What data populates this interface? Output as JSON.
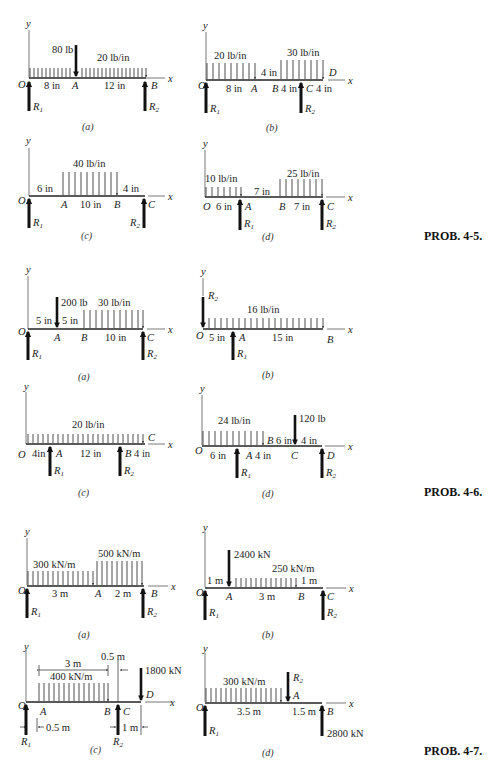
{
  "figure": {
    "problems": [
      {
        "label": "PROB. 4-5.",
        "panels": [
          {
            "caption": "(a)",
            "point_load": "80 lb",
            "dist_load": "20 lb/in",
            "dims": [
              "8 in",
              "12 in"
            ],
            "points": [
              "O",
              "A",
              "B"
            ],
            "reactions": [
              "R1",
              "R2"
            ]
          },
          {
            "caption": "(b)",
            "dist_loads": [
              "20 lb/in",
              "30 lb/in"
            ],
            "dims": [
              "8 in",
              "4 in",
              "4 in",
              "4 in"
            ],
            "points": [
              "O",
              "A",
              "B",
              "C",
              "D"
            ],
            "reactions": [
              "R1",
              "R2"
            ]
          },
          {
            "caption": "(c)",
            "dist_load": "40 lb/in",
            "dims": [
              "6 in",
              "10 in",
              "4 in"
            ],
            "points": [
              "O",
              "A",
              "B",
              "C"
            ],
            "reactions": [
              "R1",
              "R2"
            ]
          },
          {
            "caption": "(d)",
            "dist_loads": [
              "10 lb/in",
              "25 lb/in"
            ],
            "dims": [
              "6 in",
              "7 in",
              "7 in"
            ],
            "points": [
              "O",
              "A",
              "B",
              "C"
            ],
            "reactions": [
              "R1",
              "R2"
            ]
          }
        ]
      },
      {
        "label": "PROB. 4-6.",
        "panels": [
          {
            "caption": "(a)",
            "point_load": "200 lb",
            "dist_load": "30 lb/in",
            "dims": [
              "5 in",
              "5 in",
              "10 in"
            ],
            "points": [
              "O",
              "A",
              "B",
              "C"
            ],
            "reactions": [
              "R1",
              "R2"
            ]
          },
          {
            "caption": "(b)",
            "dist_load": "16 lb/in",
            "dims": [
              "5 in",
              "15 in"
            ],
            "points": [
              "O",
              "A",
              "B"
            ],
            "reactions": [
              "R1",
              "R2"
            ]
          },
          {
            "caption": "(c)",
            "dist_load": "20 lb/in",
            "dims": [
              "4in",
              "12 in",
              "4 in"
            ],
            "points": [
              "O",
              "A",
              "B",
              "C"
            ],
            "reactions": [
              "R1",
              "R2"
            ]
          },
          {
            "caption": "(d)",
            "point_load": "120 lb",
            "dist_load": "24 lb/in",
            "dims": [
              "6 in",
              "4 in",
              "6 in",
              "4 in"
            ],
            "points": [
              "O",
              "A",
              "B",
              "C",
              "D"
            ],
            "reactions": [
              "R1",
              "R2"
            ]
          }
        ]
      },
      {
        "label": "PROB. 4-7.",
        "panels": [
          {
            "caption": "(a)",
            "dist_loads": [
              "300 kN/m",
              "500 kN/m"
            ],
            "dims": [
              "3 m",
              "2 m"
            ],
            "points": [
              "O",
              "A",
              "B"
            ],
            "reactions": [
              "R1",
              "R2"
            ]
          },
          {
            "caption": "(b)",
            "point_load": "2400 kN",
            "dist_load": "250 kN/m",
            "dims": [
              "1 m",
              "3 m",
              "1 m"
            ],
            "points": [
              "O",
              "A",
              "B",
              "C"
            ],
            "reactions": [
              "R1",
              "R2"
            ]
          },
          {
            "caption": "(c)",
            "point_load": "1800 kN",
            "dist_load": "400 kN/m",
            "dims": [
              "3 m",
              "0.5 m",
              "0.5 m",
              "1 m"
            ],
            "points": [
              "O",
              "A",
              "B",
              "C",
              "D"
            ],
            "reactions": [
              "R1",
              "R2"
            ]
          },
          {
            "caption": "(d)",
            "point_load": "2800 kN",
            "dist_load": "300 kN/m",
            "dims": [
              "3.5 m",
              "1.5 m"
            ],
            "points": [
              "O",
              "A",
              "B"
            ],
            "reactions": [
              "R1",
              "R2"
            ]
          }
        ]
      }
    ]
  },
  "labels": {
    "y": "y",
    "x": "x",
    "O": "O",
    "A": "A",
    "B": "B",
    "C": "C",
    "D": "D",
    "R": "R",
    "sub1": "1",
    "sub2": "2",
    "p5": "PROB. 4-5.",
    "p6": "PROB. 4-6.",
    "p7": "PROB. 4-7.",
    "ca": "(a)",
    "cb": "(b)",
    "cc": "(c)",
    "cd": "(d)",
    "l80": "80 lb",
    "l20in": "20 lb/in",
    "l30in": "30 lb/in",
    "l40in": "40 lb/in",
    "l10in": "10 lb/in",
    "l25in": "25 lb/in",
    "l200": "200 lb",
    "l16in": "16 lb/in",
    "l24in": "24 lb/in",
    "l120": "120 lb",
    "l300m": "300 kN/m",
    "l500m": "500 kN/m",
    "l2400": "2400 kN",
    "l250m": "250 kN/m",
    "l400m": "400 kN/m",
    "l1800": "1800 kN",
    "l2800": "2800 kN",
    "d8": "8 in",
    "d12": "12 in",
    "d4": "4 in",
    "d6": "6 in",
    "d10": "10 in",
    "d7": "7 in",
    "d5": "5 in",
    "d15": "15 in",
    "d4b": "4in",
    "m3": "3 m",
    "m2": "2 m",
    "m1": "1 m",
    "m05": "0.5 m",
    "m35": "3.5 m",
    "m15": "1.5 m"
  }
}
